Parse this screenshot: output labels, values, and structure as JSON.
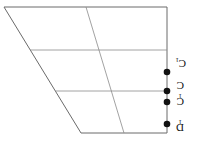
{
  "diagram": {
    "colors": {
      "grid": "#8a8a8a",
      "edge": "#6a6a6a",
      "point": "#111111",
      "background": "#ffffff"
    },
    "outline": [
      [
        4,
        7
      ],
      [
        167,
        7
      ],
      [
        167,
        133
      ],
      [
        81,
        133
      ]
    ],
    "horizontal_lines_y": [
      50,
      91
    ],
    "inner_slant": {
      "from": [
        86,
        7
      ],
      "to": [
        124,
        133
      ]
    },
    "points": [
      {
        "id": "p1",
        "y": 72,
        "label": "C",
        "sub": "1"
      },
      {
        "id": "p2",
        "y": 91,
        "label": "C",
        "sub": ""
      },
      {
        "id": "p3",
        "y": 102,
        "label": "C",
        "sub": "1"
      },
      {
        "id": "p4",
        "y": 124,
        "label": "D",
        "sub": "1"
      }
    ],
    "label_rotation_deg": 180
  }
}
